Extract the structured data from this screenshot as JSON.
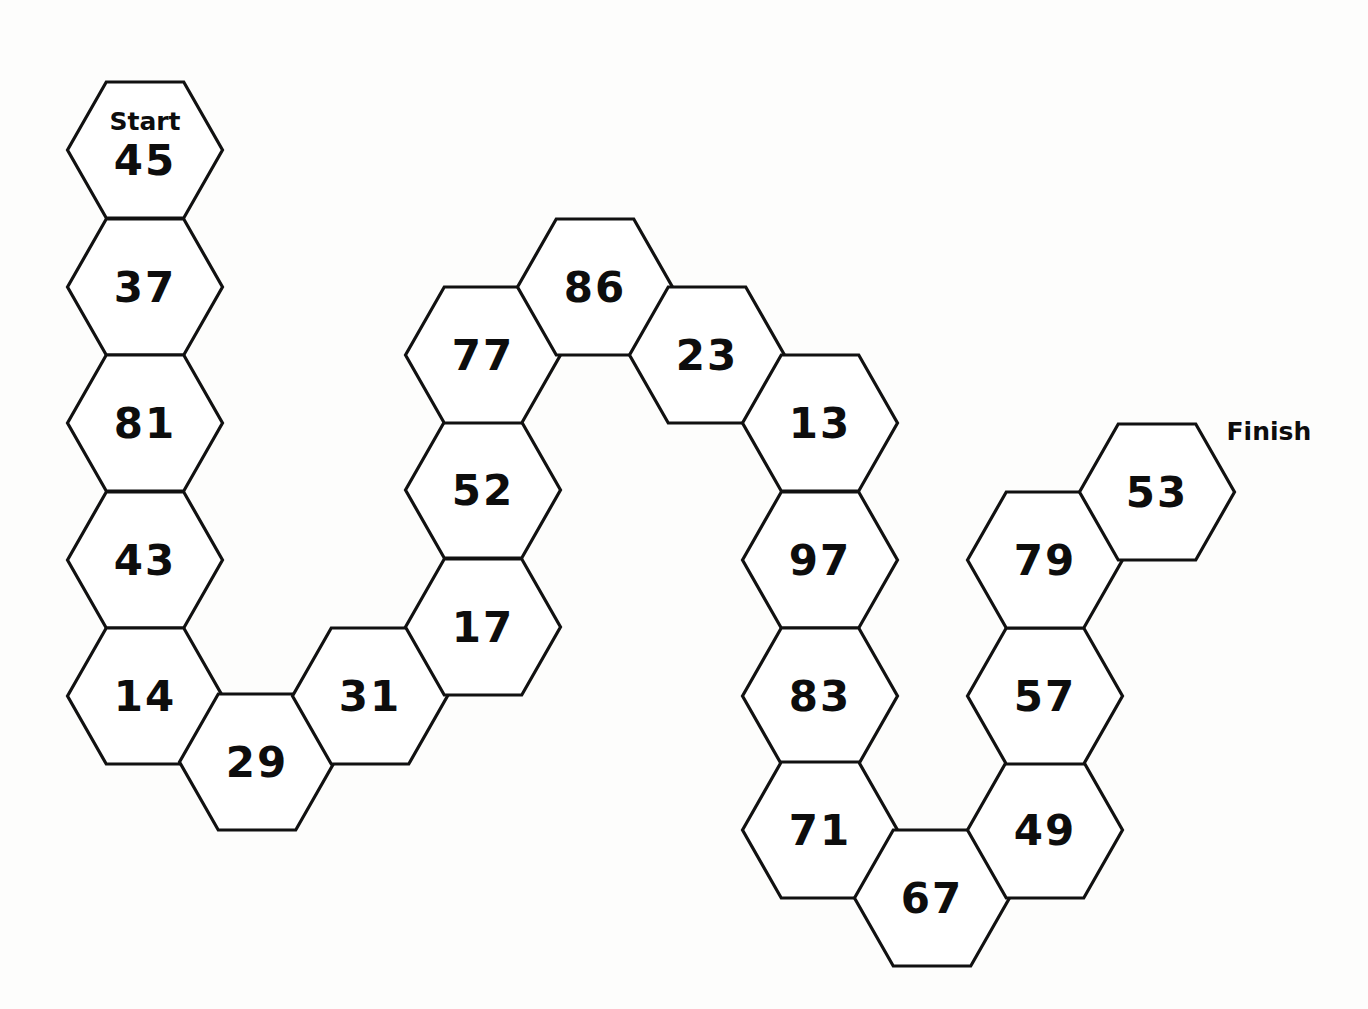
{
  "board": {
    "title": "Hexagon Number Path",
    "background_color": "#fdfdfc",
    "hex_fill_color": "#ffffff",
    "hex_stroke_color": "#111111",
    "text_color": "#0d0d0d",
    "start_label": "Start",
    "finish_label": "Finish",
    "hex_width": 155,
    "hex_height": 136
  },
  "chart_data": {
    "type": "diagram",
    "hex_orientation": "flat-top",
    "hex_width": 155,
    "hex_height": 136,
    "horizontal_step": 112,
    "vertical_step": 136,
    "path_order": [
      45,
      37,
      81,
      43,
      14,
      29,
      31,
      17,
      52,
      77,
      86,
      23,
      13,
      97,
      83,
      71,
      67,
      49,
      57,
      79,
      53
    ],
    "start_value": 45,
    "finish_value": 53,
    "count": 21,
    "cells": [
      {
        "value": "45",
        "cx": 145,
        "cy": 150,
        "marker": "Start",
        "marker_position": "inside-top"
      },
      {
        "value": "37",
        "cx": 145,
        "cy": 287,
        "marker": null,
        "marker_position": null
      },
      {
        "value": "81",
        "cx": 145,
        "cy": 423,
        "marker": null,
        "marker_position": null
      },
      {
        "value": "43",
        "cx": 145,
        "cy": 560,
        "marker": null,
        "marker_position": null
      },
      {
        "value": "14",
        "cx": 145,
        "cy": 696,
        "marker": null,
        "marker_position": null
      },
      {
        "value": "29",
        "cx": 257,
        "cy": 762,
        "marker": null,
        "marker_position": null
      },
      {
        "value": "31",
        "cx": 370,
        "cy": 696,
        "marker": null,
        "marker_position": null
      },
      {
        "value": "17",
        "cx": 483,
        "cy": 627,
        "marker": null,
        "marker_position": null
      },
      {
        "value": "52",
        "cx": 483,
        "cy": 490,
        "marker": null,
        "marker_position": null
      },
      {
        "value": "77",
        "cx": 483,
        "cy": 355,
        "marker": null,
        "marker_position": null
      },
      {
        "value": "86",
        "cx": 595,
        "cy": 287,
        "marker": null,
        "marker_position": null
      },
      {
        "value": "23",
        "cx": 707,
        "cy": 355,
        "marker": null,
        "marker_position": null
      },
      {
        "value": "13",
        "cx": 820,
        "cy": 423,
        "marker": null,
        "marker_position": null
      },
      {
        "value": "97",
        "cx": 820,
        "cy": 560,
        "marker": null,
        "marker_position": null
      },
      {
        "value": "83",
        "cx": 820,
        "cy": 696,
        "marker": null,
        "marker_position": null
      },
      {
        "value": "71",
        "cx": 820,
        "cy": 830,
        "marker": null,
        "marker_position": null
      },
      {
        "value": "67",
        "cx": 932,
        "cy": 898,
        "marker": null,
        "marker_position": null
      },
      {
        "value": "49",
        "cx": 1045,
        "cy": 830,
        "marker": null,
        "marker_position": null
      },
      {
        "value": "57",
        "cx": 1045,
        "cy": 696,
        "marker": null,
        "marker_position": null
      },
      {
        "value": "79",
        "cx": 1045,
        "cy": 560,
        "marker": null,
        "marker_position": null
      },
      {
        "value": "53",
        "cx": 1157,
        "cy": 492,
        "marker": "Finish",
        "marker_position": "outside-right"
      }
    ]
  }
}
